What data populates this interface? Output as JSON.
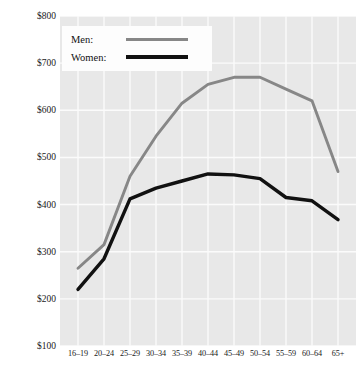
{
  "chart_data": {
    "type": "line",
    "title": "",
    "xlabel": "",
    "ylabel": "Median weekly earnings, 1995",
    "categories": [
      "16–19",
      "20–24",
      "25–29",
      "30–34",
      "35–39",
      "40–44",
      "45–49",
      "50–54",
      "55–59",
      "60–64",
      "65+"
    ],
    "ylim": [
      100,
      800
    ],
    "ytick_labels": [
      "$100",
      "$200",
      "$300",
      "$400",
      "$500",
      "$600",
      "$700",
      "$800"
    ],
    "ytick_values": [
      100,
      200,
      300,
      400,
      500,
      600,
      700,
      800
    ],
    "grid": true,
    "legend_position": "top-left",
    "series": [
      {
        "name": "Men:",
        "color": "#878787",
        "values": [
          265,
          315,
          460,
          545,
          615,
          655,
          670,
          670,
          645,
          620,
          470
        ]
      },
      {
        "name": "Women:",
        "color": "#111111",
        "values": [
          220,
          285,
          412,
          435,
          450,
          465,
          463,
          455,
          415,
          408,
          368
        ]
      }
    ]
  }
}
